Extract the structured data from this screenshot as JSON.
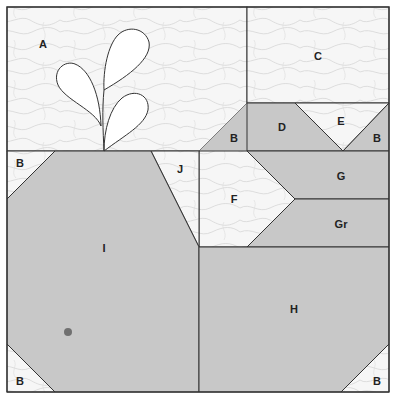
{
  "diagram": {
    "type": "quilt-block-pattern",
    "colors": {
      "light_fabric": "#f6f6f6",
      "light_texture_line": "#d4d4d4",
      "dark_fabric": "#c8c8c8",
      "outline": "#333333",
      "leaf_fill": "#ffffff",
      "dot": "#707070"
    },
    "pieces": {
      "A": "A",
      "B1": "B",
      "B2": "B",
      "B3": "B",
      "B4": "B",
      "B5": "B",
      "B6": "B",
      "C": "C",
      "D": "D",
      "E": "E",
      "F": "F",
      "G": "G",
      "Gr": "Gr",
      "H": "H",
      "I": "I",
      "J": "J"
    }
  }
}
